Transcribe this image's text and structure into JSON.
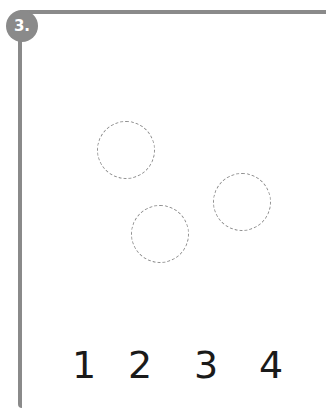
{
  "exercise": {
    "number_label": "3.",
    "badge_color": "#8a8a8a",
    "frame_color": "#8a8a8a"
  },
  "circles": [
    {
      "cx": 126,
      "cy": 150,
      "r": 29
    },
    {
      "cx": 160,
      "cy": 234,
      "r": 29
    },
    {
      "cx": 242,
      "cy": 202,
      "r": 29
    }
  ],
  "answer_options": [
    "1",
    "2",
    "3",
    "4"
  ]
}
